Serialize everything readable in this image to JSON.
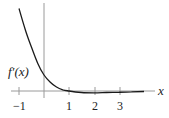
{
  "chart_data": {
    "type": "line",
    "title": "",
    "series": [
      {
        "name": "f'(x)",
        "x": [
          -1,
          -0.75,
          -0.5,
          -0.25,
          0,
          0.25,
          0.5,
          0.75,
          1,
          1.5,
          2,
          2.5,
          3,
          3.5,
          4
        ],
        "values": [
          3.3,
          2.45,
          1.75,
          1.1,
          0.64,
          0.35,
          0.16,
          0.05,
          0,
          -0.06,
          -0.07,
          -0.06,
          -0.05,
          -0.03,
          -0.02
        ]
      }
    ],
    "curve_label": "f′(x)",
    "xlabel": "x",
    "ylabel": "",
    "x_ticks": [
      "-1",
      "1",
      "2",
      "3"
    ],
    "xlim": [
      -1,
      4
    ],
    "grid": false,
    "legend": "none"
  },
  "labels": {
    "curve": "f′(x)",
    "x_axis": "x",
    "tick_m1": "−1",
    "tick_1": "1",
    "tick_2": "2",
    "tick_3": "3"
  },
  "colors": {
    "axis": "#9a9a9a",
    "curve": "#1a1a1a",
    "text": "#222222"
  }
}
